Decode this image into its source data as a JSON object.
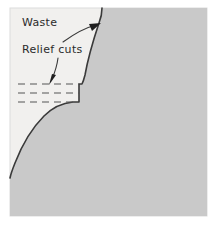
{
  "figure": {
    "kind": "technical-illustration",
    "canvas": {
      "width": 218,
      "height": 226
    },
    "colors": {
      "page_background": "#ffffff",
      "waste_region": "#f1f0ee",
      "workpiece_fill": "#c9c9c9",
      "outline": "#3a3a3a",
      "relief_cut_line": "#555555",
      "label_text": "#2b2b2b",
      "frame_border": "#d8d8d8"
    },
    "frame": {
      "x": 10,
      "y": 8,
      "width": 197,
      "height": 208
    },
    "labels": [
      {
        "id": "waste",
        "text": "Waste",
        "x": 22,
        "y": 26
      },
      {
        "id": "relief-cuts",
        "text": "Relief cuts",
        "x": 22,
        "y": 53
      }
    ],
    "leader_lines": [
      {
        "id": "waste-leader",
        "from_label": "Waste",
        "path": "M 63 42 C 74 34 84 28 96 25",
        "arrow_tip": {
          "x": 100,
          "y": 24
        },
        "arrow_angle_deg": -14
      },
      {
        "id": "relief-cuts-leader",
        "from_label": "Relief cuts",
        "path": "M 58 58 C 57 66 55 72 52 79",
        "arrow_tip": {
          "x": 50,
          "y": 84
        },
        "arrow_angle_deg": 108
      }
    ],
    "relief_cuts": [
      {
        "id": "relief-cut-1",
        "x1": 18,
        "x2": 79,
        "y": 84
      },
      {
        "id": "relief-cut-2",
        "x1": 18,
        "x2": 79,
        "y": 93
      },
      {
        "id": "relief-cut-3",
        "x1": 18,
        "x2": 73,
        "y": 102
      },
      {
        "id": "relief-cut-count",
        "count": 3,
        "dash_pattern": "7 5"
      }
    ],
    "profile": {
      "id": "workpiece-profile",
      "note": "Stepped shoulder with two concave arcs meeting the step",
      "step_outer_top_x": 102,
      "step_outer_top_y": 10,
      "step_shelf_y": 84,
      "step_inner_x": 79,
      "step_lower_shelf_y": 102,
      "step_lower_inner_x": 73
    }
  }
}
